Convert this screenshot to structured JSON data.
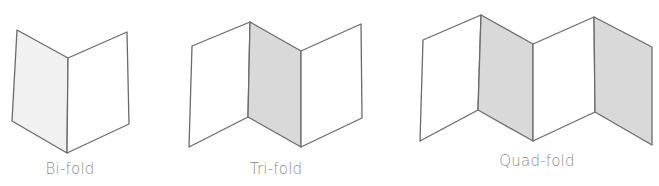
{
  "diagram": {
    "colors": {
      "stroke": "#6b6b6b",
      "panel_white": "#ffffff",
      "panel_light": "#f1f1f1",
      "panel_gray": "#d9d9d9",
      "label": "#8c8c8c"
    },
    "items": [
      {
        "id": "bi-fold",
        "label": "Bi-fold",
        "panels": 2
      },
      {
        "id": "tri-fold",
        "label": "Tri-fold",
        "panels": 3
      },
      {
        "id": "quad-fold",
        "label": "Quad-fold",
        "panels": 4
      }
    ]
  }
}
